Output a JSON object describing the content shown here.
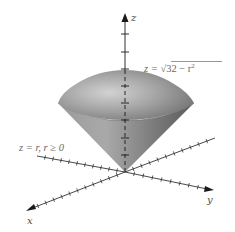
{
  "figure": {
    "surfaces": [
      {
        "name": "sphere-cap",
        "equation": "z = √(32 − r²)"
      },
      {
        "name": "cone",
        "equation": "z = r,   r ≥ 0"
      }
    ],
    "labels": {
      "z_axis": "z",
      "x_axis": "x",
      "y_axis": "y",
      "upper_eq_lhs": "z = ",
      "upper_eq_radical": "√",
      "upper_eq_radicand": "32 − r",
      "upper_eq_exp": "2",
      "lower_eq": "z = r,   r ≥ 0"
    },
    "colors": {
      "surface_dark": "#5e5e5e",
      "surface_mid": "#8c8c8c",
      "surface_light": "#c4c4c4",
      "axis": "#1a1a1a",
      "text": "#555555"
    }
  }
}
